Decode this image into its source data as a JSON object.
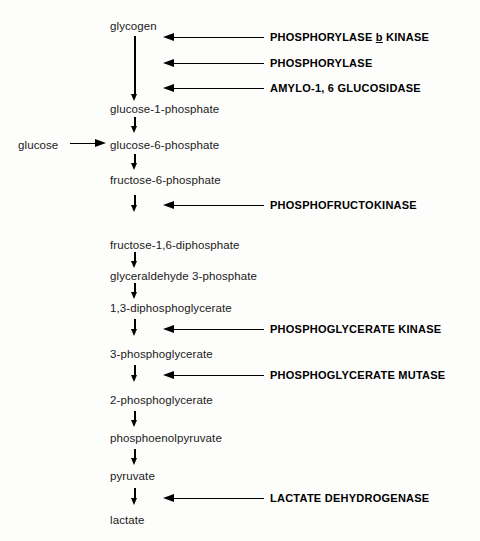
{
  "diagram": {
    "background_color": "#fdfdfb",
    "ink_color": "#111111",
    "metabolites": [
      {
        "id": "glycogen",
        "label": "glycogen",
        "x": 110,
        "y": 20
      },
      {
        "id": "glucose-1-phosphate",
        "label": "glucose-1-phosphate",
        "x": 110,
        "y": 103
      },
      {
        "id": "glucose",
        "label": "glucose",
        "x": 18,
        "y": 139
      },
      {
        "id": "glucose-6-phosphate",
        "label": "glucose-6-phosphate",
        "x": 110,
        "y": 139
      },
      {
        "id": "fructose-6-phosphate",
        "label": "fructose-6-phosphate",
        "x": 110,
        "y": 174
      },
      {
        "id": "fructose-1-6-diphosphate",
        "label": "fructose-1,6-diphosphate",
        "x": 110,
        "y": 239
      },
      {
        "id": "glyceraldehyde-3-phosphate",
        "label": "glyceraldehyde 3-phosphate",
        "x": 110,
        "y": 270
      },
      {
        "id": "1-3-diphosphoglycerate",
        "label": "1,3-diphosphoglycerate",
        "x": 110,
        "y": 302
      },
      {
        "id": "3-phosphoglycerate",
        "label": "3-phosphoglycerate",
        "x": 110,
        "y": 348
      },
      {
        "id": "2-phosphoglycerate",
        "label": "2-phosphoglycerate",
        "x": 110,
        "y": 394
      },
      {
        "id": "phosphoenolpyruvate",
        "label": "phosphoenolpyruvate",
        "x": 110,
        "y": 432
      },
      {
        "id": "pyruvate",
        "label": "pyruvate",
        "x": 110,
        "y": 470
      },
      {
        "id": "lactate",
        "label": "lactate",
        "x": 110,
        "y": 514
      }
    ],
    "enzymes": [
      {
        "id": "phosphorylase-b-kinase",
        "label_prefix": "PHOSPHORYLASE ",
        "label_italic_b": "b",
        "label_suffix": " KINASE",
        "label": "PHOSPHORYLASE b KINASE",
        "y": 33,
        "arrow_from_x": 264,
        "arrow_to_x": 163
      },
      {
        "id": "phosphorylase",
        "label": "PHOSPHORYLASE",
        "y": 59,
        "arrow_from_x": 264,
        "arrow_to_x": 163
      },
      {
        "id": "amylo-1-6-glucosidase",
        "label": "AMYLO-1, 6 GLUCOSIDASE",
        "y": 84,
        "arrow_from_x": 264,
        "arrow_to_x": 163
      },
      {
        "id": "phosphofructokinase",
        "label": "PHOSPHOFRUCTOKINASE",
        "y": 201,
        "arrow_from_x": 264,
        "arrow_to_x": 163
      },
      {
        "id": "phosphoglycerate-kinase",
        "label": "PHOSPHOGLYCERATE KINASE",
        "y": 325,
        "arrow_from_x": 264,
        "arrow_to_x": 163
      },
      {
        "id": "phosphoglycerate-mutase",
        "label": "PHOSPHOGLYCERATE MUTASE",
        "y": 371,
        "arrow_from_x": 264,
        "arrow_to_x": 163
      },
      {
        "id": "lactate-dehydrogenase",
        "label": "LACTATE DEHYDROGENASE",
        "y": 494,
        "arrow_from_x": 264,
        "arrow_to_x": 163
      }
    ],
    "chain_arrows": [
      {
        "id": "glycogen-to-g1p",
        "top": 36,
        "length": 58
      },
      {
        "id": "g1p-to-g6p",
        "top": 117,
        "length": 16
      },
      {
        "id": "g6p-to-f6p",
        "top": 154,
        "length": 16
      },
      {
        "id": "f6p-to-fdp",
        "top": 196,
        "length": 17
      },
      {
        "id": "fdp-to-gap",
        "top": 252,
        "length": 16
      },
      {
        "id": "gap-to-13dpg",
        "top": 283,
        "length": 16
      },
      {
        "id": "13dpg-to-3pg",
        "top": 320,
        "length": 17
      },
      {
        "id": "3pg-to-2pg",
        "top": 366,
        "length": 17
      },
      {
        "id": "2pg-to-pep",
        "top": 412,
        "length": 16
      },
      {
        "id": "pep-to-pyruvate",
        "top": 450,
        "length": 16
      },
      {
        "id": "pyruvate-to-lactate",
        "top": 489,
        "length": 17
      }
    ],
    "entry_arrow": {
      "id": "glucose-to-g6p",
      "x": 70,
      "y": 139,
      "length": 34
    }
  }
}
